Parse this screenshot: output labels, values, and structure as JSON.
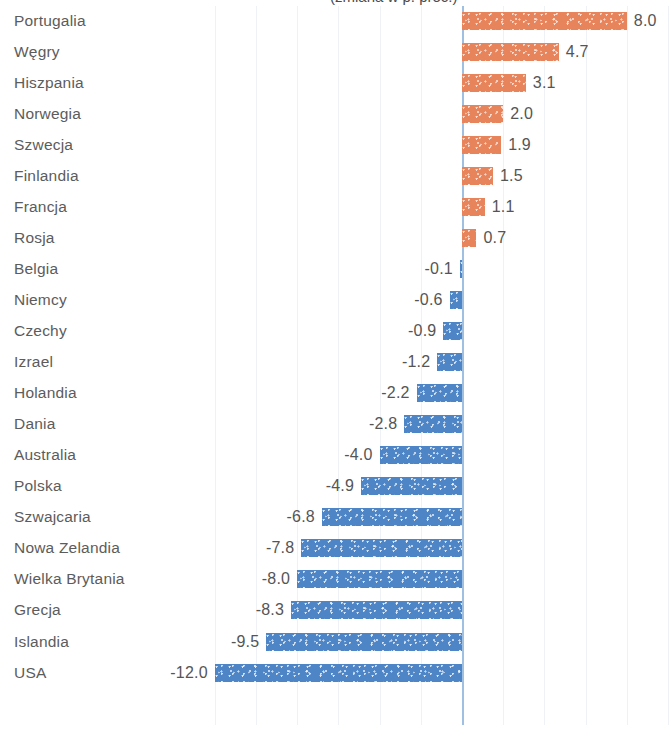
{
  "title": {
    "text": "(zmiana w p. proc.)",
    "cropped": true
  },
  "colors": {
    "positive_bar": "#e8845c",
    "negative_bar": "#4d85c6",
    "zero_axis": "#9fc0e0",
    "gridline": "#eef1f5",
    "label_text": "#5c5c5c",
    "value_text": "#555555",
    "background": "#ffffff"
  },
  "chart_data": {
    "type": "bar",
    "orientation": "horizontal",
    "title": "(zmiana w p. proc.)",
    "xlabel": "",
    "ylabel": "",
    "xlim": [
      -12.8,
      10.2
    ],
    "grid": true,
    "grid_interval": 2,
    "legend": "none",
    "zero_line": 0,
    "categories": [
      "Portugalia",
      "Węgry",
      "Hiszpania",
      "Norwegia",
      "Szwecja",
      "Finlandia",
      "Francja",
      "Rosja",
      "Belgia",
      "Niemcy",
      "Czechy",
      "Izrael",
      "Holandia",
      "Dania",
      "Australia",
      "Polska",
      "Szwajcaria",
      "Nowa Zelandia",
      "Wielka Brytania",
      "Grecja",
      "Islandia",
      "USA"
    ],
    "values": [
      8.0,
      4.7,
      3.1,
      2.0,
      1.9,
      1.5,
      1.1,
      0.7,
      -0.1,
      -0.6,
      -0.9,
      -1.2,
      -2.2,
      -2.8,
      -4.0,
      -4.9,
      -6.8,
      -7.8,
      -8.0,
      -8.3,
      -9.5,
      -12.0
    ],
    "value_labels": [
      "8.0",
      "4.7",
      "3.1",
      "2.0",
      "1.9",
      "1.5",
      "1.1",
      "0.7",
      "-0.1",
      "-0.6",
      "-0.9",
      "-1.2",
      "-2.2",
      "-2.8",
      "-4.0",
      "-4.9",
      "-6.8",
      "-7.8",
      "-8.0",
      "-8.3",
      "-9.5",
      "-12.0"
    ]
  }
}
